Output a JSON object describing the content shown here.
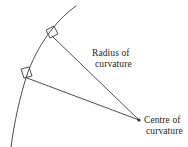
{
  "figure": {
    "background_color": "#ffffff",
    "stroke_color": "#3a3a3a",
    "text_color": "#262626"
  },
  "labels": {
    "radius": {
      "line1": "Radius of",
      "line2": "curvature",
      "x": 92,
      "y": 48
    },
    "centre": {
      "line1": "Centre of",
      "line2": "curvature",
      "x": 144,
      "y": 115
    }
  },
  "geometry": {
    "arc": {
      "name": "curved-surface-arc",
      "path": "M 76 6 C 60 17 40 40 28 72 C 20 95 14 124 11 147",
      "stroke_width": 0.9
    },
    "radius_lines": [
      {
        "name": "radius-line-upper",
        "x1": 52,
        "y1": 36,
        "x2": 139,
        "y2": 120,
        "stroke_width": 0.9
      },
      {
        "name": "radius-line-lower",
        "x1": 27,
        "y1": 78,
        "x2": 139,
        "y2": 120,
        "stroke_width": 0.9
      }
    ],
    "right_angle_markers": [
      {
        "name": "right-angle-marker-upper",
        "points": "46,30 54,26 58,34 50,38",
        "stroke_width": 0.9
      },
      {
        "name": "right-angle-marker-lower",
        "points": "21,69 29,67 32,76 24,78",
        "stroke_width": 0.9
      }
    ],
    "centre_point": {
      "name": "centre-of-curvature-point",
      "cx": 139,
      "cy": 120,
      "r": 1.6
    }
  }
}
